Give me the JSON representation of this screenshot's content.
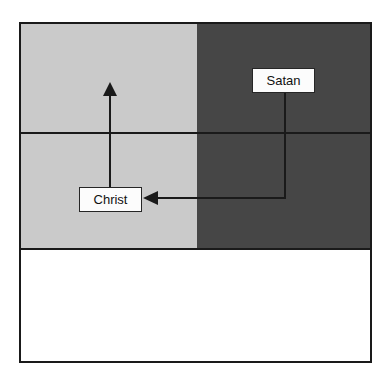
{
  "diagram": {
    "nodes": {
      "satan": {
        "label": "Satan",
        "region": "dark"
      },
      "christ": {
        "label": "Christ",
        "region": "light"
      }
    },
    "edges": [
      {
        "from": "satan",
        "to": "christ",
        "style": "elbow",
        "arrowhead": "left"
      },
      {
        "from": "christ",
        "to": "upper-left-area",
        "style": "straight",
        "arrowhead": "up"
      }
    ],
    "regions": [
      {
        "name": "light-gray-left-band"
      },
      {
        "name": "dark-gray-right-band"
      },
      {
        "name": "blank-bottom-band"
      }
    ]
  },
  "colors": {
    "region_light": "#cacaca",
    "region_dark": "#464646",
    "line": "#1a1a1a",
    "node_bg": "#fcfcfc",
    "node_border": "#262626",
    "page_bg": "#ffffff"
  }
}
